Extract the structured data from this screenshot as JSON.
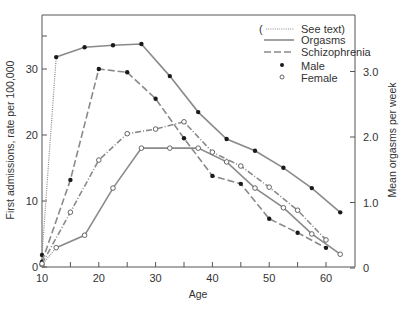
{
  "chart_data": {
    "type": "line",
    "title": "",
    "xlabel": "Age",
    "ylabel": "First admissions, rate per 100,000",
    "ylabel_right": "Mean orgasms per week",
    "xlim": [
      10,
      65
    ],
    "ylim": [
      0,
      38
    ],
    "ylim_right": [
      0,
      3.8
    ],
    "x_ticks": [
      10,
      20,
      30,
      40,
      50,
      60
    ],
    "x_minor_ticks": [
      15,
      25,
      35,
      45,
      55
    ],
    "y_ticks": [
      0,
      10,
      20,
      30
    ],
    "y_tick_labels": [
      "0",
      "10",
      "20",
      "30"
    ],
    "y_right_ticks": [
      0,
      1.0,
      2.0,
      3.0
    ],
    "y_right_tick_labels": [
      "0",
      "1.0",
      "2.0",
      "3.0"
    ],
    "grid": false,
    "legend_position": "upper right",
    "legend": [
      {
        "label": "(",
        "suffix": "See text)",
        "style": "dotted"
      },
      {
        "label": "Orgasms",
        "style": "solid"
      },
      {
        "label": "Schizophrenia",
        "style": "dashed"
      },
      {
        "label": "Male",
        "marker": "filled-circle"
      },
      {
        "label": "Female",
        "marker": "open-circle"
      }
    ],
    "series": [
      {
        "name": "Male orgasms",
        "axis": "right",
        "style": "solid",
        "marker": "filled",
        "x": [
          10,
          12.5,
          17.5,
          22.5,
          27.5,
          32.5,
          37.5,
          42.5,
          47.5,
          52.5,
          57.5,
          62.5
        ],
        "values": [
          0.2,
          3.22,
          3.37,
          3.4,
          3.42,
          2.93,
          2.38,
          1.97,
          1.79,
          1.53,
          1.22,
          0.85
        ],
        "dotted_first_segment": true
      },
      {
        "name": "Female orgasms",
        "axis": "right",
        "style": "solid",
        "marker": "open",
        "x": [
          10,
          12.5,
          17.5,
          22.5,
          27.5,
          32.5,
          37.5,
          42.5,
          47.5,
          52.5,
          57.5,
          62.5
        ],
        "values": [
          0.05,
          0.31,
          0.5,
          1.22,
          1.83,
          1.83,
          1.83,
          1.62,
          1.22,
          0.92,
          0.52,
          0.21
        ],
        "dotted_first_segment": false
      },
      {
        "name": "Male schizophrenia",
        "axis": "left",
        "style": "dashed",
        "marker": "filled",
        "x": [
          10,
          15,
          20,
          25,
          30,
          35,
          40,
          45,
          50,
          55,
          60
        ],
        "values": [
          0.8,
          13.2,
          30.0,
          29.5,
          25.5,
          19.5,
          13.8,
          12.6,
          7.3,
          5.2,
          2.9
        ]
      },
      {
        "name": "Female schizophrenia",
        "axis": "left",
        "style": "dashdot",
        "marker": "open",
        "x": [
          10,
          15,
          20,
          25,
          30,
          35,
          40,
          45,
          50,
          55,
          60
        ],
        "values": [
          0.5,
          8.3,
          16.2,
          20.2,
          20.9,
          22.0,
          17.4,
          15.3,
          12.1,
          8.6,
          4.1
        ]
      }
    ]
  },
  "colors": {
    "line": "#8a8a8a",
    "axis": "#555555",
    "marker_fill": "#1a1a1a",
    "text": "#333333"
  }
}
